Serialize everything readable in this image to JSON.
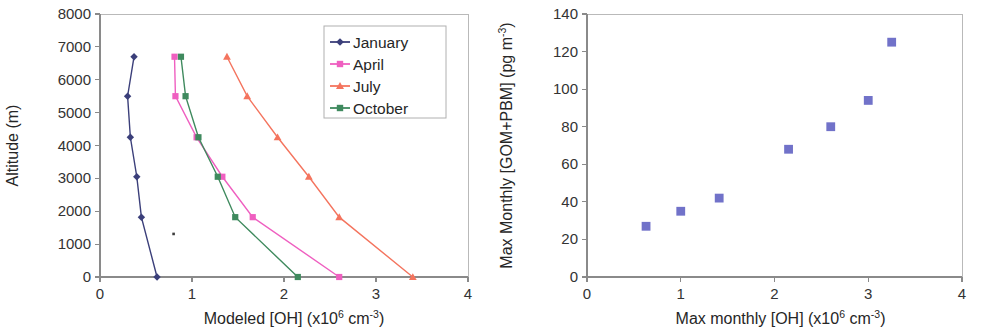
{
  "figure": {
    "panels": [
      "left-profile-chart",
      "right-scatter-chart"
    ]
  },
  "chart_data": [
    {
      "id": "modeled-oh-altitude-profile",
      "type": "line",
      "title": "",
      "xlabel": "Modeled [OH]  (x106 cm-3)",
      "xlabel_parts": {
        "main": "Modeled [OH]  (x10",
        "sup1": "6",
        "mid": " cm",
        "sup2": "-3",
        "tail": ")"
      },
      "ylabel": "Altitude (m)",
      "xlim": [
        0,
        4
      ],
      "ylim": [
        0,
        8000
      ],
      "xticks": [
        0,
        1,
        2,
        3,
        4
      ],
      "xticklabels": [
        "0",
        "1",
        "2",
        "3",
        "4"
      ],
      "yticks": [
        0,
        1000,
        2000,
        3000,
        4000,
        5000,
        6000,
        7000,
        8000
      ],
      "yticklabels": [
        "0",
        "1000",
        "2000",
        "3000",
        "4000",
        "5000",
        "6000",
        "7000",
        "8000"
      ],
      "grid": false,
      "legend_position": "top-right",
      "orientation": "x-is-value, y-is-altitude",
      "series": [
        {
          "name": "January",
          "color": "#3b3f7a",
          "marker": "diamond",
          "x": [
            0.62,
            0.45,
            0.4,
            0.33,
            0.3,
            0.37
          ],
          "y": [
            0,
            1820,
            3050,
            4250,
            5500,
            6700
          ]
        },
        {
          "name": "April",
          "color": "#ef5fc0",
          "marker": "square",
          "x": [
            2.6,
            1.66,
            1.33,
            1.05,
            0.82,
            0.81
          ],
          "y": [
            0,
            1820,
            3050,
            4250,
            5500,
            6700
          ]
        },
        {
          "name": "July",
          "color": "#f4745e",
          "marker": "triangle",
          "x": [
            3.4,
            2.6,
            2.27,
            1.93,
            1.6,
            1.38
          ],
          "y": [
            0,
            1820,
            3050,
            4250,
            5500,
            6700
          ]
        },
        {
          "name": "October",
          "color": "#3f8a5e",
          "marker": "square",
          "x": [
            2.15,
            1.47,
            1.28,
            1.07,
            0.93,
            0.88
          ],
          "y": [
            0,
            1820,
            3050,
            4250,
            5500,
            6700
          ]
        }
      ],
      "artifacts": [
        {
          "name": "scan-speckle",
          "x": 0.8,
          "y": 1310
        }
      ]
    },
    {
      "id": "max-monthly-gom-pbm-vs-oh",
      "type": "scatter",
      "title": "",
      "xlabel": "Max monthly [OH]  (x106 cm-3)",
      "xlabel_parts": {
        "main": "Max monthly [OH]  (x10",
        "sup1": "6",
        "mid": " cm",
        "sup2": "-3",
        "tail": ")"
      },
      "ylabel": "Max Monthly [GOM+PBM]  (pg m-3)",
      "ylabel_parts": {
        "main": "Max Monthly [GOM+PBM]  (pg m",
        "sup1": "-3",
        "tail": ")"
      },
      "xlim": [
        0,
        4
      ],
      "ylim": [
        0,
        140
      ],
      "xticks": [
        0,
        1,
        2,
        3,
        4
      ],
      "xticklabels": [
        "0",
        "1",
        "2",
        "3",
        "4"
      ],
      "yticks": [
        0,
        20,
        40,
        60,
        80,
        100,
        120,
        140
      ],
      "yticklabels": [
        "0",
        "20",
        "40",
        "60",
        "80",
        "100",
        "120",
        "140"
      ],
      "grid": false,
      "marker": "square",
      "color": "#7172c9",
      "points": [
        {
          "x": 0.63,
          "y": 27
        },
        {
          "x": 1.0,
          "y": 35
        },
        {
          "x": 1.41,
          "y": 42
        },
        {
          "x": 2.15,
          "y": 68
        },
        {
          "x": 2.6,
          "y": 80
        },
        {
          "x": 3.0,
          "y": 94
        },
        {
          "x": 3.25,
          "y": 125
        }
      ]
    }
  ]
}
